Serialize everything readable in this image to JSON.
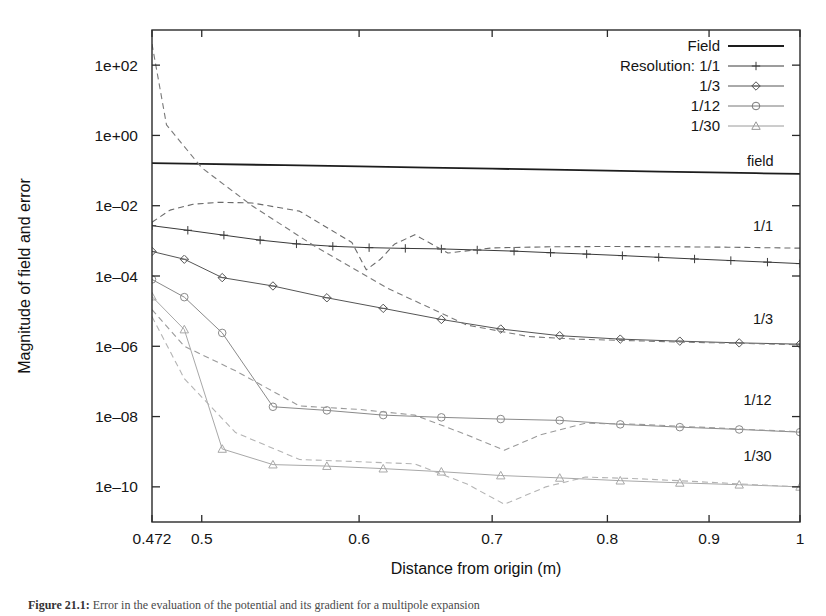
{
  "figure": {
    "caption_label": "Figure 21.1:",
    "caption_text": "Error in the evaluation of the potential and its gradient for a multipole expansion"
  },
  "axes": {
    "xlabel": "Distance from origin (m)",
    "ylabel": "Magnitude of field and error",
    "xticks": [
      {
        "value": 0.472,
        "label": "0.472"
      },
      {
        "value": 0.5,
        "label": "0.5"
      },
      {
        "value": 0.6,
        "label": "0.6"
      },
      {
        "value": 0.7,
        "label": "0.7"
      },
      {
        "value": 0.8,
        "label": "0.8"
      },
      {
        "value": 0.9,
        "label": "0.9"
      },
      {
        "value": 1.0,
        "label": "1"
      }
    ],
    "yticks": [
      {
        "value": 100.0,
        "label": "1e+02"
      },
      {
        "value": 1.0,
        "label": "1e+00"
      },
      {
        "value": 0.01,
        "label": "1e–02"
      },
      {
        "value": 0.0001,
        "label": "1e–04"
      },
      {
        "value": 1e-06,
        "label": "1e–06"
      },
      {
        "value": 1e-08,
        "label": "1e–08"
      },
      {
        "value": 1e-10,
        "label": "1e–10"
      }
    ],
    "xlim": [
      0.472,
      1.0
    ],
    "ylim": [
      1e-11,
      1000.0
    ],
    "xscale": "log",
    "yscale": "log",
    "grid": false
  },
  "legend": {
    "position": "top-right",
    "entries": [
      {
        "label": "Field",
        "style": "solid",
        "marker": "none",
        "color": "#1d1d1d"
      },
      {
        "label": "Resolution: 1/1",
        "style": "solid",
        "marker": "plus",
        "color": "#3a3a3a"
      },
      {
        "label": "1/3",
        "style": "solid",
        "marker": "diamond",
        "color": "#555555"
      },
      {
        "label": "1/12",
        "style": "solid",
        "marker": "circle",
        "color": "#777777"
      },
      {
        "label": "1/30",
        "style": "solid",
        "marker": "triangle",
        "color": "#9a9a9a"
      }
    ]
  },
  "curve_labels": [
    {
      "text": "field",
      "x": 0.955,
      "y": 0.135
    },
    {
      "text": "1/1",
      "x": 0.958,
      "y": 0.0019
    },
    {
      "text": "1/3",
      "x": 0.958,
      "y": 4.3e-06
    },
    {
      "text": "1/12",
      "x": 0.952,
      "y": 2.1e-08
    },
    {
      "text": "1/30",
      "x": 0.952,
      "y": 5.5e-10
    }
  ],
  "chart_data": {
    "type": "line",
    "title": "",
    "xlabel": "Distance from origin (m)",
    "ylabel": "Magnitude of field and error",
    "xscale": "log",
    "yscale": "log",
    "xlim": [
      0.472,
      1.0
    ],
    "ylim": [
      1e-11,
      1000.0
    ],
    "grid": false,
    "legend_position": "top-right",
    "series": [
      {
        "name": "Field",
        "style": "solid",
        "marker": "none",
        "color": "#1d1d1d",
        "width": 1.8,
        "x": [
          0.472,
          0.5,
          0.55,
          0.6,
          0.65,
          0.7,
          0.75,
          0.8,
          0.85,
          0.9,
          0.95,
          1.0
        ],
        "y": [
          0.163,
          0.155,
          0.142,
          0.131,
          0.121,
          0.113,
          0.106,
          0.0995,
          0.0938,
          0.0888,
          0.0843,
          0.0802
        ]
      },
      {
        "name": "Resolution: 1/1",
        "style": "solid",
        "marker": "plus",
        "color": "#3a3a3a",
        "width": 1.0,
        "x": [
          0.472,
          0.492,
          0.513,
          0.535,
          0.558,
          0.582,
          0.607,
          0.633,
          0.66,
          0.688,
          0.718,
          0.749,
          0.781,
          0.814,
          0.849,
          0.885,
          0.923,
          0.963,
          1.0
        ],
        "y": [
          0.0027,
          0.002,
          0.00145,
          0.00105,
          0.00082,
          0.0007,
          0.00064,
          0.00061,
          0.00059,
          0.00055,
          0.00051,
          0.00046,
          0.00042,
          0.00038,
          0.00034,
          0.000305,
          0.000275,
          0.000248,
          0.000225
        ]
      },
      {
        "name": "1/1 error",
        "style": "dashed",
        "marker": "none",
        "color": "#6a6a6a",
        "width": 1.1,
        "x": [
          0.472,
          0.482,
          0.495,
          0.51,
          0.53,
          0.56,
          0.595,
          0.605,
          0.615,
          0.625,
          0.64,
          0.665,
          0.7,
          0.75,
          0.8,
          0.86,
          0.92,
          1.0
        ],
        "y": [
          0.0034,
          0.0075,
          0.011,
          0.0125,
          0.012,
          0.007,
          0.0009,
          0.00015,
          0.0003,
          0.0008,
          0.0015,
          0.00045,
          0.00063,
          0.00068,
          0.00069,
          0.00068,
          0.00066,
          0.00062
        ]
      },
      {
        "name": "1/3",
        "style": "solid",
        "marker": "diamond",
        "color": "#555555",
        "width": 1.0,
        "x": [
          0.472,
          0.49,
          0.512,
          0.543,
          0.578,
          0.617,
          0.66,
          0.707,
          0.757,
          0.812,
          0.87,
          0.932,
          1.0
        ],
        "y": [
          0.0005,
          0.0003,
          9e-05,
          5.2e-05,
          2.4e-05,
          1.2e-05,
          5.8e-06,
          3.1e-06,
          2e-06,
          1.6e-06,
          1.4e-06,
          1.25e-06,
          1.15e-06
        ]
      },
      {
        "name": "1/3 error",
        "style": "dashed",
        "marker": "none",
        "color": "#7a7a7a",
        "width": 1.1,
        "x": [
          0.472,
          0.48,
          0.5,
          0.53,
          0.57,
          0.62,
          0.68,
          0.73,
          0.77,
          0.82,
          0.88,
          0.94,
          1.0
        ],
        "y": [
          400.0,
          2.0,
          0.12,
          0.01,
          0.0007,
          4.5e-05,
          4e-06,
          1.9e-06,
          1.6e-06,
          1.45e-06,
          1.3e-06,
          1.2e-06,
          1.1e-06
        ]
      },
      {
        "name": "1/12",
        "style": "solid",
        "marker": "circle",
        "color": "#8a8a8a",
        "width": 1.0,
        "x": [
          0.472,
          0.49,
          0.512,
          0.543,
          0.578,
          0.617,
          0.66,
          0.707,
          0.757,
          0.812,
          0.87,
          0.932,
          1.0
        ],
        "y": [
          8e-05,
          2.5e-05,
          2.4e-06,
          1.9e-08,
          1.5e-08,
          1.1e-08,
          9.5e-09,
          8.5e-09,
          7.8e-09,
          6e-09,
          5e-09,
          4.3e-09,
          3.6e-09
        ]
      },
      {
        "name": "1/12 error",
        "style": "dashed",
        "marker": "none",
        "color": "#9a9a9a",
        "width": 1.1,
        "x": [
          0.472,
          0.49,
          0.52,
          0.56,
          0.6,
          0.64,
          0.68,
          0.71,
          0.74,
          0.78,
          0.83,
          0.89,
          0.95,
          1.0
        ],
        "y": [
          1.1e-05,
          1e-06,
          2e-07,
          2e-08,
          1.6e-08,
          1.1e-08,
          3e-09,
          1.1e-09,
          3e-09,
          6.5e-09,
          6e-09,
          5e-09,
          4.2e-09,
          3.7e-09
        ]
      },
      {
        "name": "1/30",
        "style": "solid",
        "marker": "triangle",
        "color": "#a8a8a8",
        "width": 1.0,
        "x": [
          0.472,
          0.49,
          0.512,
          0.543,
          0.578,
          0.617,
          0.66,
          0.707,
          0.757,
          0.812,
          0.87,
          0.932,
          1.0
        ],
        "y": [
          2.6e-05,
          3e-06,
          1.2e-09,
          4.3e-10,
          3.9e-10,
          3.3e-10,
          2.7e-10,
          2.1e-10,
          1.8e-10,
          1.5e-10,
          1.3e-10,
          1.15e-10,
          1e-10
        ]
      },
      {
        "name": "1/30 error",
        "style": "dashed",
        "marker": "none",
        "color": "#b4b4b4",
        "width": 1.1,
        "x": [
          0.472,
          0.49,
          0.52,
          0.56,
          0.6,
          0.64,
          0.68,
          0.71,
          0.745,
          0.78,
          0.83,
          0.89,
          0.95,
          1.0
        ],
        "y": [
          7e-06,
          1.2e-07,
          3.5e-09,
          6e-10,
          5.2e-10,
          4.5e-10,
          1.2e-10,
          3.2e-11,
          1e-10,
          1.9e-10,
          1.7e-10,
          1.4e-10,
          1.15e-10,
          1e-10
        ]
      }
    ]
  }
}
